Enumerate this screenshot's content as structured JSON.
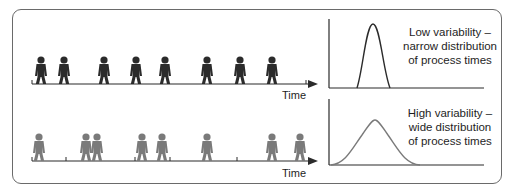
{
  "rows": [
    {
      "id": "low",
      "axis_label": "Time",
      "figure_color": "#2b2b2b",
      "figure_positions": [
        41,
        64,
        104,
        136,
        165,
        207,
        240,
        272
      ],
      "tick_positions": [
        32,
        308
      ],
      "distribution": {
        "type": "narrow",
        "curve_color": "#2b2b2b",
        "label_lines": [
          "Low variability –",
          "narrow distribution",
          "of process times"
        ]
      }
    },
    {
      "id": "high",
      "axis_label": "Time",
      "figure_color": "#7a7a7a",
      "figure_positions": [
        39,
        86,
        97,
        142,
        162,
        207,
        272,
        300
      ],
      "tick_positions": [
        32,
        66,
        135,
        170,
        237
      ],
      "distribution": {
        "type": "wide",
        "curve_color": "#7a7a7a",
        "label_lines": [
          "High variability –",
          "wide distribution",
          "of process times"
        ]
      }
    }
  ],
  "colors": {
    "frame": "#6a6a6a",
    "axis": "#2b2b2b",
    "text": "#1e1e1e"
  }
}
